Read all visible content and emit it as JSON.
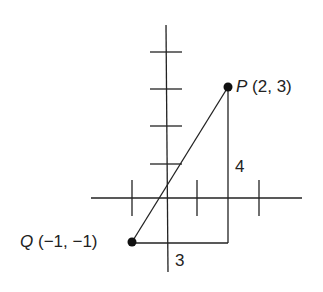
{
  "points": {
    "P": {
      "name": "P",
      "coords": "(2, 3)",
      "x": 2,
      "y": 3
    },
    "Q": {
      "name": "Q",
      "coords": "(−1, −1)",
      "x": -1,
      "y": -1
    }
  },
  "legs": {
    "vertical": "4",
    "horizontal": "3"
  },
  "axes": {
    "x_ticks": [
      -1,
      1,
      3
    ],
    "y_ticks": [
      1,
      2,
      3,
      4
    ]
  },
  "colors": {
    "line": "#222222",
    "background": "#ffffff"
  }
}
